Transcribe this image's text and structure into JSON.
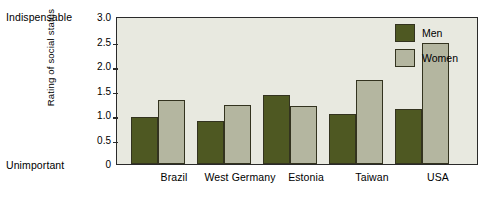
{
  "chart_data": {
    "type": "bar",
    "title": "",
    "xlabel": "",
    "ylabel": "Rating of social status",
    "categories": [
      "Brazil",
      "West Germany",
      "Estonia",
      "Taiwan",
      "USA"
    ],
    "series": [
      {
        "name": "Men",
        "color": "#4e5822",
        "values": [
          0.95,
          0.88,
          1.4,
          1.03,
          1.13
        ]
      },
      {
        "name": "Women",
        "color": "#b4b6a0",
        "values": [
          1.31,
          1.2,
          1.18,
          1.72,
          2.46
        ]
      }
    ],
    "ylim": [
      0,
      3.0
    ],
    "yticks": [
      0,
      0.5,
      1.0,
      1.5,
      2.0,
      2.5,
      3.0
    ],
    "ytick_labels": [
      "0",
      "0.5",
      "1.0",
      "1.5",
      "2.0",
      "2.5",
      "3.0"
    ],
    "axis_anchor_top": "Indispensable",
    "axis_anchor_bottom": "Unimportant",
    "grid": false,
    "legend_position": "top-right",
    "plot_background": "#e8e9e0",
    "axis_color": "#2a2a2a"
  },
  "legend": {
    "items": [
      {
        "label": "Men"
      },
      {
        "label": "Women"
      }
    ]
  }
}
